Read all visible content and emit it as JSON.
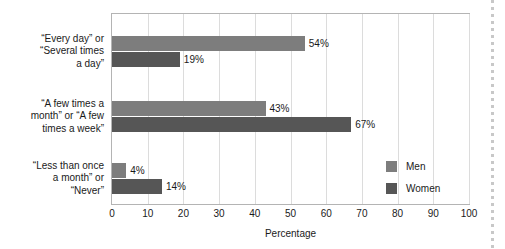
{
  "chart_data": {
    "type": "bar",
    "orientation": "horizontal",
    "title": "",
    "xlabel": "Percentage",
    "ylabel": "",
    "xlim": [
      0,
      100
    ],
    "xticks": [
      0,
      10,
      20,
      30,
      40,
      50,
      60,
      70,
      80,
      90,
      100
    ],
    "xtick_labels": [
      "0",
      "10",
      "20",
      "30",
      "40",
      "50",
      "60",
      "70",
      "80",
      "90",
      "100"
    ],
    "grid": "vertical",
    "legend_position": "inside-right",
    "categories": [
      "“Every day” or “Several times a day”",
      "“A few times a month” or “A few times a week”",
      "“Less than once a month” or “Never”"
    ],
    "category_label_lines": [
      [
        "“Every day” or",
        "“Several times",
        "a day”"
      ],
      [
        "“A few times a",
        "month” or “A few",
        "times a week”"
      ],
      [
        "“Less than once",
        "a month” or",
        "“Never”"
      ]
    ],
    "series": [
      {
        "name": "Men",
        "color": "#7d7d7d",
        "values": [
          54,
          43,
          4
        ],
        "value_labels": [
          "54%",
          "43%",
          "4%"
        ]
      },
      {
        "name": "Women",
        "color": "#565656",
        "values": [
          19,
          67,
          14
        ],
        "value_labels": [
          "19%",
          "67%",
          "14%"
        ]
      }
    ]
  },
  "legend": {
    "items": [
      {
        "label": "Men",
        "color": "#7d7d7d"
      },
      {
        "label": "Women",
        "color": "#565656"
      }
    ]
  },
  "axis": {
    "x_title": "Percentage"
  }
}
